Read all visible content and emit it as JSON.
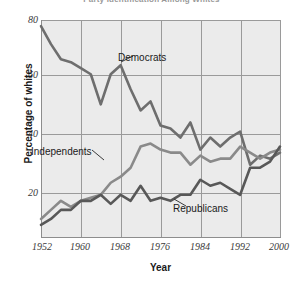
{
  "chart_title": "Party Identification Among Whites",
  "axes": {
    "x_title": "Year",
    "y_title": "Percentage of whites",
    "y_ticks": [
      "80",
      "60",
      "40",
      "20"
    ],
    "x_ticks": [
      "1952",
      "1960",
      "1968",
      "1976",
      "1984",
      "1992",
      "2000"
    ]
  },
  "annotations": {
    "democrats": "Democrats",
    "independents": "Independents",
    "republicans": "Republicans"
  },
  "colors": {
    "plot_background": "#ebebeb",
    "gridline": "#9a9a9a",
    "axis": "#8d8d8d",
    "democrats": "#6e6e6e",
    "independents": "#8a8a8a",
    "republicans": "#585858",
    "text": "#1a1a1a"
  },
  "chart_data": {
    "type": "line",
    "title": "Party Identification Among Whites",
    "xlabel": "Year",
    "ylabel": "Percentage of whites",
    "xlim": [
      1952,
      2000
    ],
    "ylim": [
      8,
      80
    ],
    "grid": true,
    "legend": "inline-annotations",
    "x": [
      1952,
      1954,
      1956,
      1958,
      1960,
      1962,
      1964,
      1966,
      1968,
      1970,
      1972,
      1974,
      1976,
      1978,
      1980,
      1982,
      1984,
      1986,
      1988,
      1990,
      1992,
      1994,
      1996,
      1998,
      2000
    ],
    "series": [
      {
        "name": "Democrats",
        "values": [
          78,
          72,
          67,
          66,
          64,
          62,
          52,
          62,
          65,
          57,
          50,
          53,
          45,
          44,
          41,
          46,
          37,
          41,
          38,
          41,
          43,
          32,
          35,
          34,
          36
        ]
      },
      {
        "name": "Independents",
        "values": [
          14,
          17,
          20,
          18,
          20,
          21,
          22,
          26,
          28,
          31,
          38,
          39,
          37,
          36,
          36,
          32,
          35,
          33,
          34,
          34,
          38,
          36,
          34,
          36,
          37
        ]
      },
      {
        "name": "Republicans",
        "values": [
          12,
          14,
          17,
          17,
          20,
          20,
          22,
          19,
          22,
          20,
          25,
          20,
          21,
          20,
          22,
          22,
          27,
          25,
          26,
          24,
          22,
          31,
          31,
          33,
          38
        ]
      }
    ]
  }
}
